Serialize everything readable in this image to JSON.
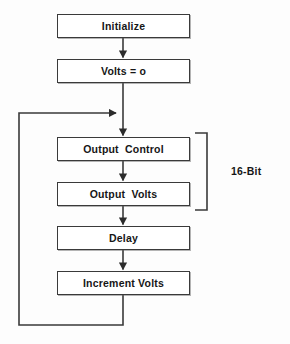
{
  "diagram": {
    "background_color": "#fdfdfd",
    "line_color": "#3a3a3a",
    "text_color": "#161616",
    "nodes": [
      {
        "id": "initialize",
        "label": "Initialize",
        "x": 57,
        "y": 14,
        "w": 133,
        "h": 24
      },
      {
        "id": "volts-zero",
        "label": "Volts = o",
        "x": 57,
        "y": 59,
        "w": 133,
        "h": 24
      },
      {
        "id": "output-control",
        "label": "Output  Control",
        "x": 57,
        "y": 137,
        "w": 133,
        "h": 24
      },
      {
        "id": "output-volts",
        "label": "Output  Volts",
        "x": 57,
        "y": 182,
        "w": 133,
        "h": 24
      },
      {
        "id": "delay",
        "label": "Delay",
        "x": 57,
        "y": 226,
        "w": 133,
        "h": 24
      },
      {
        "id": "increment-volts",
        "label": "Increment Volts",
        "x": 57,
        "y": 271,
        "w": 133,
        "h": 24
      }
    ],
    "annotation": {
      "id": "bracket-16-bit",
      "label": "16-Bit",
      "label_x": 231,
      "label_y": 166,
      "bracket_x": 207,
      "bracket_top": 133,
      "bracket_bottom": 210,
      "bracket_arm": 12
    },
    "flow": {
      "spine_x": 123,
      "feedback_x": 19,
      "junction_y": 113,
      "loop_bottom_y": 325
    }
  }
}
